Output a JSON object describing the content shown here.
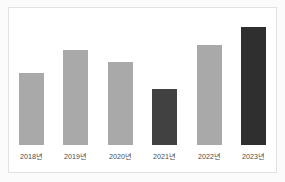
{
  "chart_data": {
    "type": "bar",
    "title": "",
    "subtitle": "",
    "xlabel": "",
    "ylabel": "",
    "categories": [
      "2018년",
      "2019년",
      "2020년",
      "2021년",
      "2022년",
      "2023년"
    ],
    "values": [
      62,
      81,
      71,
      48,
      85,
      100
    ],
    "ylim": [
      0,
      108
    ],
    "grid": false,
    "legend": null,
    "bar_colors": [
      "#a9a9a9",
      "#a9a9a9",
      "#a9a9a9",
      "#414141",
      "#a9a9a9",
      "#2f2f2f"
    ],
    "annotations": [],
    "series": [
      {
        "name": "",
        "values": [
          62,
          81,
          71,
          48,
          85,
          100
        ]
      }
    ]
  },
  "figure": {
    "background_color": "#fbfbfb",
    "panel_color": "#ffffff",
    "border_color": "#e2e2e2",
    "label_color": "#4a4a4a",
    "highlight_color": "#2f2f2f",
    "muted_color": "#a9a9a9"
  }
}
